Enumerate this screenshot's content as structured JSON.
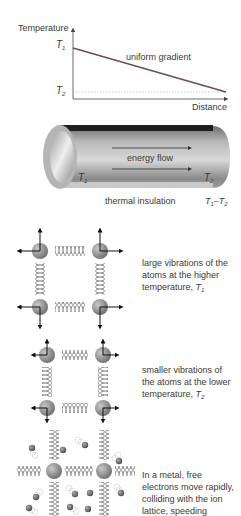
{
  "graph": {
    "y_axis_label": "Temperature",
    "x_axis_label": "Distance",
    "t1_label": "T",
    "t1_sub": "1",
    "t2_label": "T",
    "t2_sub": "2",
    "line_label": "uniform gradient",
    "colors": {
      "gradient_line": "#6b4a5a",
      "dotted_line": "#c0c0c0",
      "axes": "#444444"
    }
  },
  "pipe": {
    "flow_label": "energy flow",
    "insulation_label": "thermal insulation",
    "left_temp": "T",
    "left_temp_sub": "1",
    "right_temp": "T",
    "right_temp_sub": "2",
    "difference_label": "T",
    "difference_sub1": "1",
    "difference_mid": "–T",
    "difference_sub2": "2",
    "colors": {
      "insulation_top": "#1e1e1e",
      "pipe_mid": "#9a9a9a",
      "pipe_light": "#e0e0e0"
    }
  },
  "panels": [
    {
      "id": "hot-lattice",
      "text": "large vibrations of the atoms at the higher temperature, ",
      "temp": "T",
      "temp_sub": "1"
    },
    {
      "id": "cold-lattice",
      "text": "smaller vibrations of the atoms at the lower temperature, ",
      "temp": "T",
      "temp_sub": "2"
    },
    {
      "id": "metal-lattice",
      "text": "In a metal, free electrons move rapidly, colliding with the ion lattice, speeding"
    }
  ],
  "colors": {
    "atom": "#8c8c8c",
    "spring": "#555555",
    "arrow": "#111111",
    "electron": "#6a6a6a"
  }
}
